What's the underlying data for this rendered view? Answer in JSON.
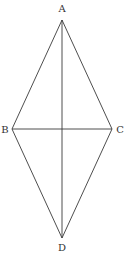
{
  "diagram": {
    "vertices": [
      {
        "id": "A",
        "label": "A"
      },
      {
        "id": "B",
        "label": "B"
      },
      {
        "id": "C",
        "label": "C"
      },
      {
        "id": "D",
        "label": "D"
      }
    ],
    "edges": [
      {
        "from": "A",
        "to": "B",
        "kind": "side"
      },
      {
        "from": "A",
        "to": "C",
        "kind": "side"
      },
      {
        "from": "B",
        "to": "D",
        "kind": "side"
      },
      {
        "from": "C",
        "to": "D",
        "kind": "side"
      },
      {
        "from": "A",
        "to": "D",
        "kind": "diagonal"
      },
      {
        "from": "B",
        "to": "C",
        "kind": "diagonal"
      }
    ],
    "colors": {
      "stroke": "#3a3a3a",
      "label": "#333333"
    }
  }
}
